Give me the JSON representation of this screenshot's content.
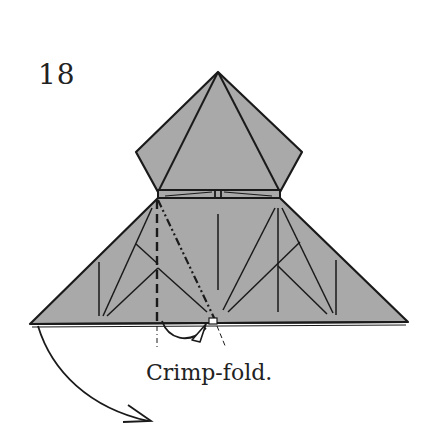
{
  "step": {
    "number": "18"
  },
  "caption": {
    "text": "Crimp-fold."
  },
  "diagram": {
    "paper_color": "#a9a9a9",
    "line_color": "#1a1a1a",
    "fold_types": [
      "valley-fold",
      "mountain-fold"
    ],
    "arrow": "turn-over-direction"
  }
}
